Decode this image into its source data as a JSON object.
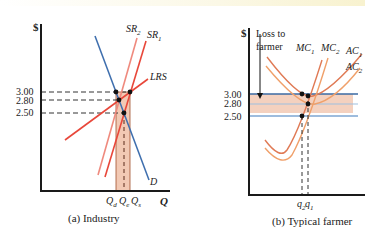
{
  "colors": {
    "axis": "#1a1a1a",
    "demand": "#3f6fae",
    "supply": "#e8473a",
    "supply_light": "#ef8a7e",
    "price_line_dark": "#3b6aa3",
    "price_line_light": "#9ebfe0",
    "shade": "#f2c9b4",
    "cost_curve_1": "#e07a55",
    "cost_curve_2": "#f0a06a",
    "point": "#111111"
  },
  "panel_a": {
    "y_axis_label": "$",
    "x_axis_label": "Q",
    "caption": "(a) Industry",
    "price_ticks": [
      "3.00",
      "2.80",
      "2.50"
    ],
    "curve_labels": {
      "sr2": "SR",
      "sr2_sub": "2",
      "sr1": "SR",
      "sr1_sub": "1",
      "lrs": "LRS",
      "demand": "D"
    },
    "quantity_labels": {
      "qd": "Q",
      "qd_sub": "d",
      "qe": "Q",
      "qe_sub": "e",
      "qs": "Q",
      "qs_sub": "s"
    }
  },
  "panel_b": {
    "y_axis_label": "$",
    "caption": "(b) Typical farmer",
    "annotation_line1": "Loss to",
    "annotation_line2": "farmer",
    "price_ticks": [
      "3.00",
      "2.80",
      "2.50"
    ],
    "curve_labels": {
      "mc1": "MC",
      "mc1_sub": "1",
      "mc2": "MC",
      "mc2_sub": "2",
      "ac1": "AC",
      "ac1_sub": "1",
      "ac2": "AC",
      "ac2_sub": "2"
    },
    "quantity_labels": {
      "q2": "q",
      "q2_sub": "2",
      "q1": "q",
      "q1_sub": "1"
    }
  }
}
